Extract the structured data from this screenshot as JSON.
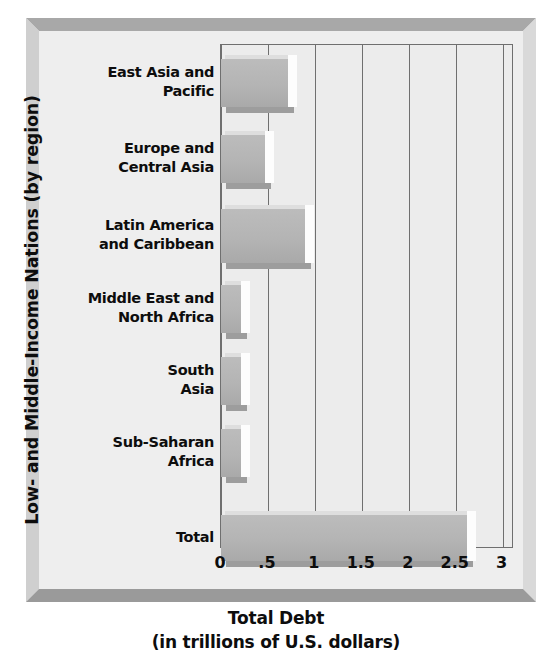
{
  "chart_data": {
    "type": "bar",
    "orientation": "horizontal",
    "title": "",
    "xlabel_line1": "Total Debt",
    "xlabel_line2": "(in trillions of U.S. dollars)",
    "ylabel": "Low- and Middle-Income Nations (by region)",
    "categories": [
      "East Asia and Pacific",
      "Europe and Central Asia",
      "Latin America and Caribbean",
      "Middle East and North Africa",
      "South Asia",
      "Sub-Saharan Africa",
      "Total"
    ],
    "category_lines": [
      [
        "East Asia and",
        "Pacific"
      ],
      [
        "Europe and",
        "Central Asia"
      ],
      [
        "Latin America",
        "and Caribbean"
      ],
      [
        "Middle East and",
        "North Africa"
      ],
      [
        "South",
        "Asia"
      ],
      [
        "Sub-Saharan",
        "Africa"
      ],
      [
        "Total"
      ]
    ],
    "values": [
      0.72,
      0.48,
      0.91,
      0.22,
      0.22,
      0.22,
      2.63
    ],
    "xlim": [
      0,
      3.1
    ],
    "xticks": [
      0,
      0.5,
      1,
      1.5,
      2,
      2.5,
      3
    ],
    "xtick_labels": [
      "0",
      ".5",
      "1",
      "1.5",
      "2",
      "2.5",
      "3"
    ],
    "grid": true,
    "legend": null,
    "bar_color": "#b4b4b4",
    "plot_background": "#ececec",
    "frame_background": "#eeeeee",
    "axis_color": "#6f6f6f",
    "text_color": "#0d0d0d"
  }
}
